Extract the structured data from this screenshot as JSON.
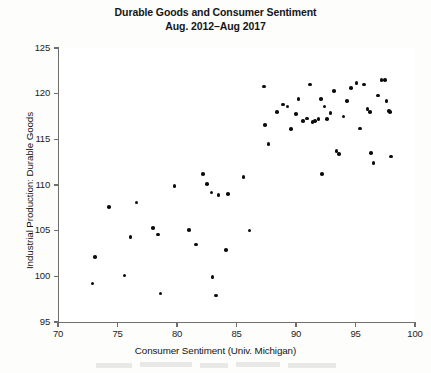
{
  "figure": {
    "title_line1": "Durable Goods and Consumer Sentiment",
    "title_line2": "Aug. 2012–Aug 2017"
  },
  "axes": {
    "xlabel": "Consumer Sentiment (Univ. Michigan)",
    "ylabel": "Industrial Production: Durable Goods",
    "xticks": [
      "70",
      "75",
      "80",
      "85",
      "90",
      "95",
      "100"
    ],
    "yticks": [
      "125",
      "120",
      "115",
      "110",
      "105",
      "100",
      "95"
    ]
  },
  "colors": {
    "marker": "#0d0d0d",
    "axis": "#6e6e6e",
    "background": "#fdfdfb",
    "text": "#161616"
  },
  "chart_data": {
    "type": "scatter",
    "title": "Durable Goods and Consumer Sentiment Aug. 2012–Aug 2017",
    "xlabel": "Consumer Sentiment (Univ. Michigan)",
    "ylabel": "Industrial Production: Durable Goods",
    "xlim": [
      70,
      100
    ],
    "ylim": [
      95,
      125
    ],
    "xtick_values": [
      70,
      75,
      80,
      85,
      90,
      95,
      100
    ],
    "ytick_values": [
      95,
      100,
      105,
      110,
      115,
      120,
      125
    ],
    "grid": false,
    "legend": "none",
    "n_points": 62,
    "marker": "filled-circle",
    "points": [
      [
        73.1,
        102.1
      ],
      [
        72.9,
        99.2
      ],
      [
        74.3,
        107.6
      ],
      [
        75.6,
        100.1
      ],
      [
        76.1,
        104.3
      ],
      [
        76.6,
        108.1
      ],
      [
        78.0,
        105.3
      ],
      [
        78.4,
        104.6
      ],
      [
        78.6,
        98.1
      ],
      [
        79.8,
        109.9
      ],
      [
        81.0,
        105.1
      ],
      [
        81.6,
        103.5
      ],
      [
        82.2,
        111.2
      ],
      [
        82.5,
        110.1
      ],
      [
        82.9,
        109.2
      ],
      [
        83.0,
        99.9
      ],
      [
        83.3,
        97.9
      ],
      [
        83.5,
        108.9
      ],
      [
        84.1,
        102.9
      ],
      [
        84.3,
        109.0
      ],
      [
        85.6,
        110.9
      ],
      [
        86.1,
        105.0
      ],
      [
        87.3,
        120.8
      ],
      [
        87.4,
        116.6
      ],
      [
        87.7,
        114.5
      ],
      [
        88.4,
        118.0
      ],
      [
        88.9,
        118.8
      ],
      [
        89.3,
        118.6
      ],
      [
        89.6,
        116.1
      ],
      [
        90.0,
        117.8
      ],
      [
        90.2,
        119.4
      ],
      [
        90.6,
        117.0
      ],
      [
        90.9,
        117.3
      ],
      [
        91.2,
        121.0
      ],
      [
        91.4,
        116.9
      ],
      [
        91.6,
        117.0
      ],
      [
        91.9,
        117.2
      ],
      [
        92.1,
        119.4
      ],
      [
        92.4,
        118.6
      ],
      [
        92.6,
        117.2
      ],
      [
        92.9,
        117.9
      ],
      [
        93.2,
        120.3
      ],
      [
        93.4,
        113.7
      ],
      [
        93.6,
        113.4
      ],
      [
        94.0,
        117.5
      ],
      [
        94.3,
        119.2
      ],
      [
        94.6,
        120.6
      ],
      [
        95.1,
        121.2
      ],
      [
        95.4,
        116.2
      ],
      [
        95.7,
        121.0
      ],
      [
        96.0,
        118.3
      ],
      [
        96.2,
        118.0
      ],
      [
        96.3,
        113.5
      ],
      [
        96.5,
        112.4
      ],
      [
        96.9,
        119.8
      ],
      [
        97.2,
        121.5
      ],
      [
        97.5,
        121.5
      ],
      [
        97.6,
        119.2
      ],
      [
        97.8,
        118.1
      ],
      [
        97.9,
        118.0
      ],
      [
        98.0,
        113.1
      ],
      [
        92.2,
        111.2
      ]
    ]
  }
}
